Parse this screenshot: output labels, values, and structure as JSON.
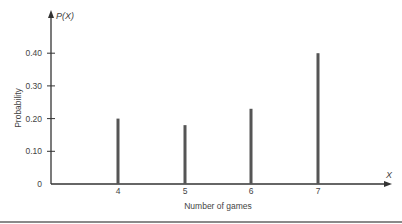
{
  "chart_data": {
    "type": "bar",
    "style": "stem/line bars",
    "title": "",
    "xlabel": "Number of games",
    "ylabel": "Probability",
    "x_axis_var": "X",
    "y_axis_var": "P(X)",
    "categories": [
      "4",
      "5",
      "6",
      "7"
    ],
    "x": [
      4,
      5,
      6,
      7
    ],
    "values": [
      0.2,
      0.18,
      0.23,
      0.4
    ],
    "yticks": [
      "0",
      "0.10",
      "0.20",
      "0.30",
      "0.40"
    ],
    "ytick_values": [
      0,
      0.1,
      0.2,
      0.3,
      0.4
    ],
    "ylim": [
      0,
      0.52
    ],
    "grid": false,
    "legend": null,
    "colors": {
      "bar": "#555555",
      "axis": "#333333",
      "rule": "#8a8a8a"
    }
  },
  "labels": {
    "x_axis_title": "Number of games",
    "y_axis_title": "Probability",
    "x_var": "X",
    "y_var": "P(X)"
  }
}
